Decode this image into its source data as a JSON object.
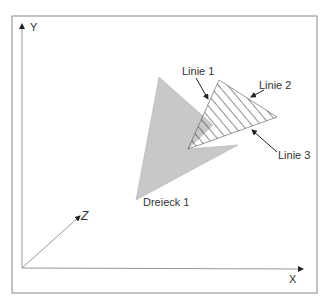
{
  "diagram": {
    "axes": {
      "x": "X",
      "y": "Y",
      "z": "Z"
    },
    "shapes": {
      "triangle_label": "Dreieck 1",
      "line1": "Linie 1",
      "line2": "Linie 2",
      "line3": "Linie 3"
    },
    "colors": {
      "triangle_fill": "#c8c8c8",
      "frame": "#888888",
      "axis": "#999999",
      "hatch": "#333333"
    }
  }
}
